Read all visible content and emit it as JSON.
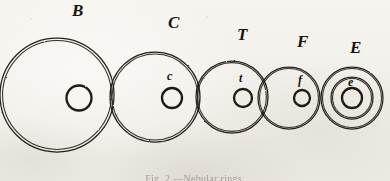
{
  "figure": {
    "caption": "Fig. 2.—Nebular rings.",
    "background_color": "#f3f1ec",
    "ink_color": "#17150f",
    "canvas": {
      "width": 390,
      "height": 181
    },
    "baseline_y": 97
  },
  "groups": [
    {
      "id": "group-b",
      "major_label": "B",
      "minor_label": "",
      "major_label_x": 72,
      "major_label_y": 2,
      "minor_label_x": 0,
      "minor_label_y": 0,
      "outer": {
        "cx": 57,
        "cy": 95,
        "r": 57
      },
      "middle": null,
      "inner": {
        "cx": 79,
        "cy": 98,
        "r": 12.5
      }
    },
    {
      "id": "group-c",
      "major_label": "C",
      "minor_label": "c",
      "major_label_x": 168,
      "major_label_y": 14,
      "minor_label_x": 167,
      "minor_label_y": 70,
      "outer": {
        "cx": 155,
        "cy": 97,
        "r": 45
      },
      "middle": null,
      "inner": {
        "cx": 172,
        "cy": 98,
        "r": 10
      }
    },
    {
      "id": "group-t",
      "major_label": "T",
      "minor_label": "t",
      "major_label_x": 237,
      "major_label_y": 26,
      "minor_label_x": 239,
      "minor_label_y": 72,
      "outer": {
        "cx": 232,
        "cy": 97,
        "r": 36
      },
      "middle": null,
      "inner": {
        "cx": 243,
        "cy": 98,
        "r": 9
      }
    },
    {
      "id": "group-f",
      "major_label": "F",
      "minor_label": "f",
      "major_label_x": 297,
      "major_label_y": 33,
      "minor_label_x": 298,
      "minor_label_y": 74,
      "outer": {
        "cx": 289,
        "cy": 98,
        "r": 31
      },
      "middle": null,
      "inner": {
        "cx": 302,
        "cy": 98,
        "r": 8
      }
    },
    {
      "id": "group-e",
      "major_label": "E",
      "minor_label": "e",
      "major_label_x": 350,
      "major_label_y": 39,
      "minor_label_x": 348,
      "minor_label_y": 76,
      "outer": {
        "cx": 352,
        "cy": 98,
        "r": 31
      },
      "middle": {
        "cx": 352,
        "cy": 98,
        "r": 21
      },
      "inner": {
        "cx": 352,
        "cy": 98,
        "r": 10
      }
    }
  ],
  "specks": [
    {
      "x": 30,
      "y": 18,
      "d": 1.6
    },
    {
      "x": 112,
      "y": 150,
      "d": 1.3
    },
    {
      "x": 206,
      "y": 16,
      "d": 1.5
    },
    {
      "x": 268,
      "y": 140,
      "d": 1.2
    },
    {
      "x": 332,
      "y": 24,
      "d": 1.4
    },
    {
      "x": 180,
      "y": 166,
      "d": 1.2
    },
    {
      "x": 66,
      "y": 160,
      "d": 1.1
    },
    {
      "x": 376,
      "y": 120,
      "d": 1.3
    },
    {
      "x": 14,
      "y": 74,
      "d": 1.2
    },
    {
      "x": 250,
      "y": 58,
      "d": 1.0
    }
  ]
}
